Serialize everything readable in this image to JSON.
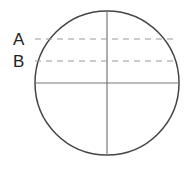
{
  "diagram": {
    "type": "circle-with-crosshair-and-levels",
    "labels": [
      {
        "id": "A",
        "text": "A"
      },
      {
        "id": "B",
        "text": "B"
      }
    ],
    "colors": {
      "circle": "#444444",
      "crosshair": "#777777",
      "dashed": "#999999",
      "text": "#222222"
    }
  }
}
